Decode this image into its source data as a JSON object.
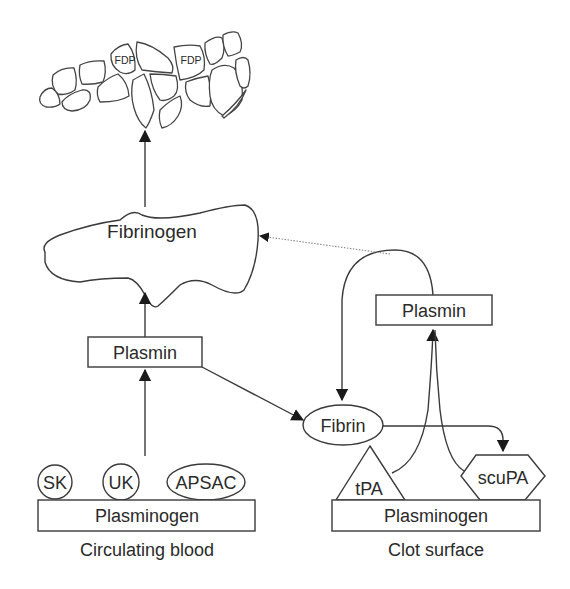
{
  "diagram": {
    "clot": {
      "label_left": "FDP",
      "label_right": "FDP"
    },
    "fibrinogen": {
      "label": "Fibrinogen"
    },
    "circulating": {
      "plasmin": "Plasmin",
      "plasminogen": "Plasminogen",
      "activators": [
        "SK",
        "UK",
        "APSAC"
      ],
      "caption": "Circulating blood"
    },
    "clot_surface": {
      "fibrin": "Fibrin",
      "plasmin": "Plasmin",
      "plasminogen": "Plasminogen",
      "activators": [
        "tPA",
        "scuPA"
      ],
      "caption": "Clot surface"
    },
    "colors": {
      "line": "#3a3a3a",
      "text": "#2a2a2a",
      "dotted_arrow": "#8a8a8a",
      "background": "#ffffff"
    }
  }
}
